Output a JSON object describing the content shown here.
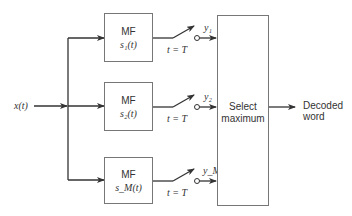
{
  "diagram": {
    "type": "block-diagram",
    "input": {
      "label": "x(t)"
    },
    "filters": [
      {
        "title": "MF",
        "signal": "s₁(t)",
        "output": "y₁",
        "sampling": "t = T"
      },
      {
        "title": "MF",
        "signal": "s₂(t)",
        "output": "y₂",
        "sampling": "t = T"
      },
      {
        "title": "MF",
        "signal": "sₘ(t)",
        "signal_display": "s_M(t)",
        "output": "y_M",
        "sampling": "t = T"
      }
    ],
    "selector": {
      "line1": "Select",
      "line2": "maximum"
    },
    "output": {
      "line1": "Decoded",
      "line2": "word"
    },
    "colors": {
      "line": "#333333",
      "box_border": "#777777",
      "background": "#ffffff"
    }
  }
}
